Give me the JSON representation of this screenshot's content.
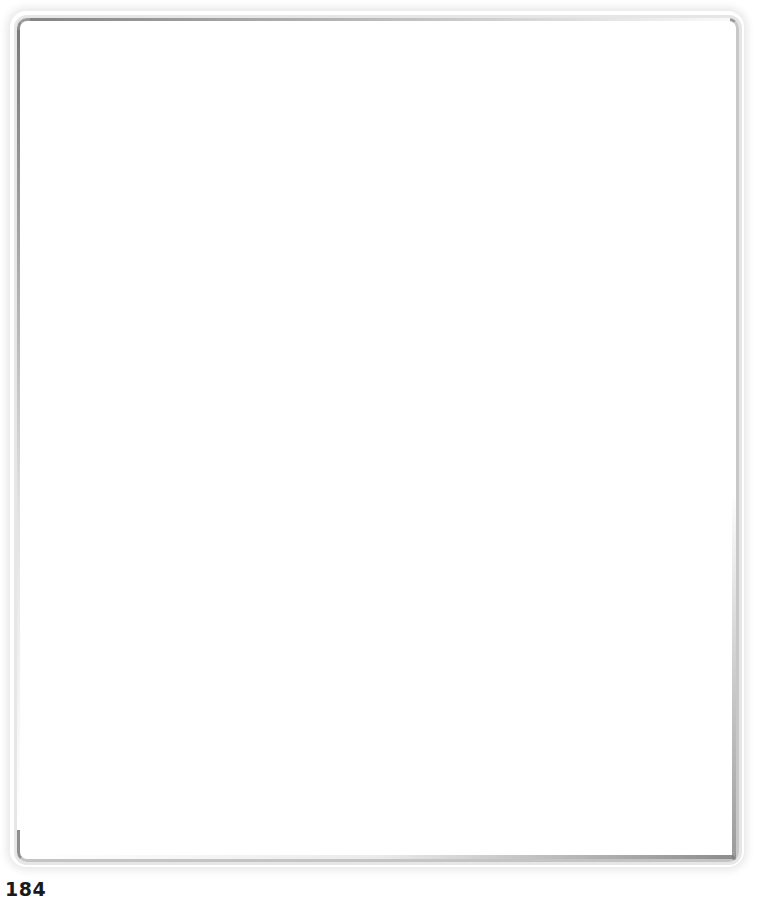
{
  "page": {
    "number": "184",
    "frame": {
      "type": "empty-bordered-box",
      "border_dark_color": "#8e8e8e",
      "border_light_color": "#e6e6e6",
      "content": ""
    }
  }
}
